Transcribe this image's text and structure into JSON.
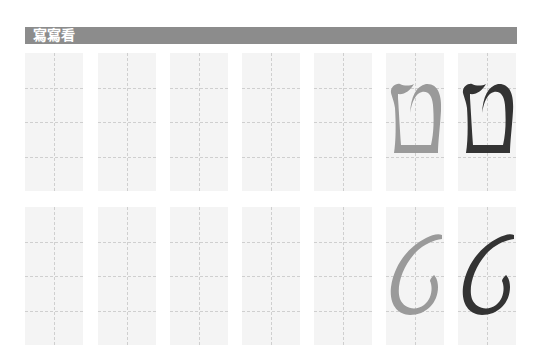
{
  "header": {
    "title": "寫寫看",
    "bar_color": "#8c8c8c",
    "text_color": "#ffffff"
  },
  "grid": {
    "rows": 2,
    "columns": 7,
    "cell_style": "tall rectangle with dashed center vertical guide and three dashed horizontal guides"
  },
  "rows": [
    {
      "letter": "ט",
      "letter_name": "tet (print form)",
      "trace_color": "#9a9a9a",
      "model_color": "#333333",
      "empty_practice_cells": 5
    },
    {
      "letter": "ט",
      "letter_name": "tet (cursive form)",
      "trace_color": "#9a9a9a",
      "model_color": "#333333",
      "empty_practice_cells": 5
    }
  ]
}
